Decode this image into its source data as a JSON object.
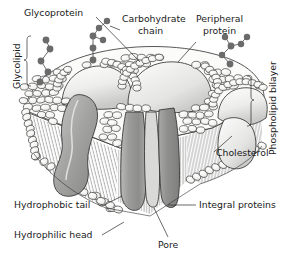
{
  "figure": {
    "width": 282,
    "height": 258,
    "background_color": "#ffffff"
  },
  "labels": {
    "glycoprotein": "Glycoprotein",
    "carbohydrate_chain_line1": "Carbohydrate",
    "carbohydrate_chain_line2": "chain",
    "peripheral_protein_line1": "Peripheral",
    "peripheral_protein_line2": "protein",
    "glycolipid": "Glycolipid",
    "phospholipid_bilayer": "Phospholipid bilayer",
    "cholesterol": "Cholesterol",
    "integral_proteins": "Integral proteins",
    "hydrophobic_tail": "Hydrophobic tail",
    "hydrophilic_head": "Hydrophilic head",
    "pore": "Pore"
  },
  "colors": {
    "background": "#ffffff",
    "outline": "#1a1a1a",
    "text": "#1a1a1a",
    "lipid_head_fill": "#f2f2f0",
    "lipid_head_stroke": "#3a3a3a",
    "protein_light": "#e8e8e6",
    "protein_mid": "#a8a8a6",
    "protein_dark": "#8e8e8c",
    "protein_shadow": "#6f6f6d",
    "carbohydrate_bead": "#6b6b6b",
    "carbohydrate_link": "#6b6b6b",
    "tail_stroke": "#4a4a4a",
    "leader_line": "#2a2a2a"
  },
  "structures": {
    "lipid_heads_top_count": 210,
    "lipid_heads_edge_count": 28,
    "integral_protein_count": 3,
    "peripheral_protein_count": 3,
    "carbohydrate_chain_count": 3,
    "pore_count": 1
  }
}
